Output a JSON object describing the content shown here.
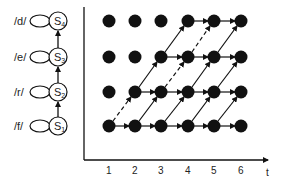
{
  "states": [
    {
      "id": "S1",
      "base": "S",
      "sub": "1",
      "phoneme": "/f/",
      "y": 126
    },
    {
      "id": "S2",
      "base": "S",
      "sub": "2",
      "phoneme": "/r/",
      "y": 92
    },
    {
      "id": "S3",
      "base": "S",
      "sub": "3",
      "phoneme": "/e/",
      "y": 57
    },
    {
      "id": "S4",
      "base": "S",
      "sub": "4",
      "phoneme": "/d/",
      "y": 21
    }
  ],
  "axis": {
    "x_label": "t",
    "ticks": [
      "1",
      "2",
      "3",
      "4",
      "5",
      "6"
    ]
  },
  "grid": {
    "columns_x": [
      109,
      135,
      161,
      188,
      214,
      241
    ],
    "rows_y": [
      126,
      92,
      57,
      21
    ]
  },
  "colors": {
    "ink": "#111111",
    "background": "#ffffff"
  }
}
